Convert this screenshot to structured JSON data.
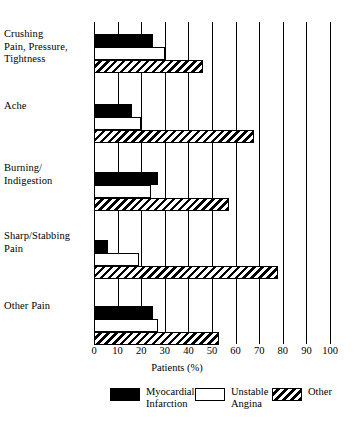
{
  "chart_data": {
    "type": "bar",
    "orientation": "horizontal",
    "title": "",
    "xlabel": "Patients (%)",
    "ylabel": "",
    "xlim": [
      0,
      100
    ],
    "xticks": [
      0,
      10,
      20,
      30,
      40,
      50,
      60,
      70,
      80,
      90,
      100
    ],
    "xtick_labels": [
      "0",
      "10",
      "20",
      "30",
      "40",
      "50",
      "60",
      "70",
      "80",
      "90",
      "100"
    ],
    "grid": "vertical",
    "legend_position": "bottom",
    "categories": [
      "Crushing\nPain, Pressure,\nTightness",
      "Ache",
      "Burning/\nIndigestion",
      "Sharp/Stabbing\nPain",
      "Other Pain"
    ],
    "series": [
      {
        "name": "Myocardial\nInfarction",
        "key": "mi",
        "fill": "solid-black",
        "color": "#000000",
        "values": [
          25,
          16,
          27,
          6,
          25
        ]
      },
      {
        "name": "Unstable\nAngina",
        "key": "ua",
        "fill": "white-outline",
        "color": "#ffffff",
        "values": [
          30,
          20,
          24,
          19,
          27
        ]
      },
      {
        "name": "Other",
        "key": "other",
        "fill": "diagonal-hatch",
        "color": "#000000",
        "values": [
          46,
          68,
          57,
          78,
          53
        ]
      }
    ]
  },
  "legend": {
    "items": [
      {
        "label": "Myocardial\nInfarction",
        "swatch": "mi"
      },
      {
        "label": "Unstable\nAngina",
        "swatch": "ua"
      },
      {
        "label": "Other",
        "swatch": "other"
      }
    ]
  },
  "axis": {
    "x_title": "Patients (%)"
  }
}
